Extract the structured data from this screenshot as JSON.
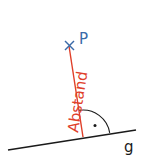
{
  "diagram": {
    "point_label": "P",
    "line_label": "g",
    "distance_label": "Abstand",
    "colors": {
      "line": "#1a1a1a",
      "distance": "#e0402a",
      "point": "#3a6aa8",
      "label_text": "#1a1a1a"
    }
  }
}
